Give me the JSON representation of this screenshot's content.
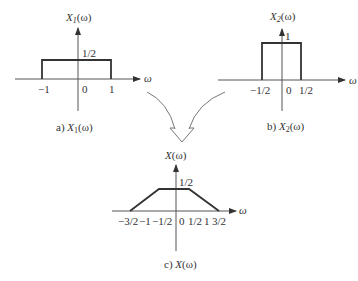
{
  "diagram": {
    "plots": [
      {
        "id": "a",
        "title": "X",
        "title_sub": "1",
        "title_arg": "(ω)",
        "x_axis_label": "ω",
        "level_label": "1/2",
        "ticks": [
          "−1",
          "0",
          "1"
        ],
        "caption_prefix": "a) ",
        "caption_fn": "X",
        "caption_sub": "1",
        "caption_arg": "(ω)",
        "shape": "rectangle",
        "support": [
          -1,
          1
        ],
        "height": 0.5
      },
      {
        "id": "b",
        "title": "X",
        "title_sub": "2",
        "title_arg": "(ω)",
        "x_axis_label": "ω",
        "level_label": "1",
        "ticks": [
          "−1/2",
          "0",
          "1/2"
        ],
        "caption_prefix": "b) ",
        "caption_fn": "X",
        "caption_sub": "2",
        "caption_arg": "(ω)",
        "shape": "rectangle",
        "support": [
          -0.5,
          0.5
        ],
        "height": 1
      },
      {
        "id": "c",
        "title": "X",
        "title_sub": "",
        "title_arg": "(ω)",
        "x_axis_label": "ω",
        "level_label": "1/2",
        "ticks": [
          "−3/2",
          "−1",
          "−1/2",
          "0",
          "1/2",
          "1",
          "3/2"
        ],
        "caption_prefix": "c) ",
        "caption_fn": "X",
        "caption_sub": "",
        "caption_arg": "(ω)",
        "shape": "trapezoid",
        "support": [
          -1.5,
          1.5
        ],
        "flat_top": [
          -0.5,
          0.5
        ],
        "height": 0.5
      }
    ],
    "arrow": {
      "meaning": "convolution combining X1 and X2 into X",
      "style": "two curved lines merging into hollow down arrow"
    }
  }
}
